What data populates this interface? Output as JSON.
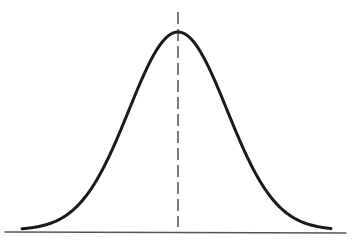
{
  "diagram": {
    "type": "normal-distribution-curve",
    "colors": {
      "background": "#ffffff",
      "curve": "#1a1a1a",
      "baseline": "#555555",
      "mean_line": "#333333"
    },
    "curve": {
      "center_x": 178,
      "peak_y": 32,
      "base_y": 230,
      "sigma": 49,
      "x_start": 22,
      "x_end": 331,
      "stroke_width": 3
    },
    "baseline": {
      "x1": 5,
      "y1": 232,
      "x2": 346,
      "y2": 233,
      "stroke_width": 1.3
    },
    "mean_line": {
      "x": 178,
      "y1": 12,
      "y2": 227,
      "dash": "12 5",
      "stroke_width": 1.3
    }
  }
}
